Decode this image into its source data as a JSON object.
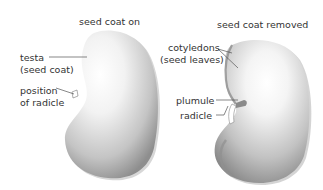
{
  "diagram": {
    "left_seed": {
      "title": "seed coat on",
      "labels": {
        "testa_line1": "testa",
        "testa_line2": "(seed coat)",
        "radicle_pos_line1": "position",
        "radicle_pos_line2": "of radicle"
      }
    },
    "right_seed": {
      "title": "seed coat removed",
      "labels": {
        "cotyledons_line1": "cotyledons",
        "cotyledons_line2": "(seed leaves)",
        "plumule": "plumule",
        "radicle": "radicle"
      }
    },
    "colors": {
      "seed_light": "#ffffff",
      "seed_mid": "#c8c8c8",
      "seed_dark": "#8a8a8a",
      "leader_line": "#555555",
      "text": "#333333"
    }
  }
}
